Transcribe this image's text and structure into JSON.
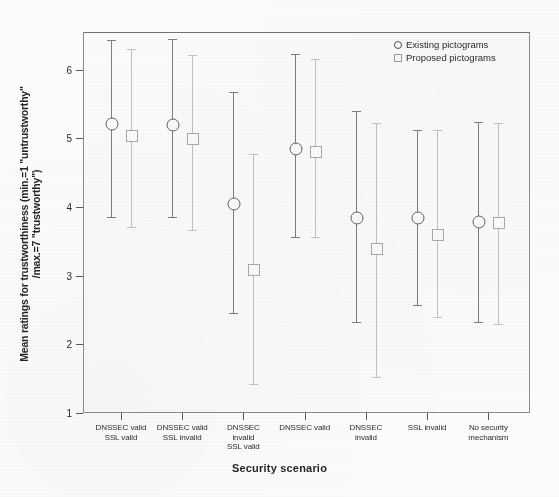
{
  "chart_data": {
    "type": "scatter",
    "title": "",
    "xlabel": "Security scenario",
    "ylabel": "Mean ratings for trustworthiness (min.=1 \"untrustworthy\" /max.=7 \"trustworthy\")",
    "ylabel_line1": "Mean ratings for trustworthiness (min.=1 \"untrustworthy\"",
    "ylabel_line2": "/max.=7 \"trustworthy\")",
    "ylim": [
      1,
      6.55
    ],
    "yticks": [
      1,
      2,
      3,
      4,
      5,
      6
    ],
    "ytick_labels": [
      "1",
      "2",
      "3",
      "4",
      "5",
      "6"
    ],
    "grid": false,
    "legend_position": "top-right",
    "error_bar_type": "95% CI",
    "categories": [
      "DNSSEC valid\nSSL valid",
      "DNSSEC valid\nSSL invalid",
      "DNSSEC invalid\nSSL valid",
      "DNSSEC valid",
      "DNSSEC invalid",
      "SSL invalid",
      "No security mechanism"
    ],
    "category_labels": [
      [
        "DNSSEC valid",
        "SSL valid"
      ],
      [
        "DNSSEC valid",
        "SSL invalid"
      ],
      [
        "DNSSEC",
        "invalid",
        "SSL valid"
      ],
      [
        "DNSSEC valid"
      ],
      [
        "DNSSEC",
        "invalid"
      ],
      [
        "SSL invalid"
      ],
      [
        "No security",
        "mechanism"
      ]
    ],
    "series": [
      {
        "name": "Existing pictograms",
        "marker": "circle",
        "color": "#7b7b7b",
        "values": [
          5.22,
          5.21,
          4.06,
          4.86,
          3.85,
          3.85,
          3.79
        ],
        "ci_lower": [
          3.85,
          3.86,
          2.46,
          3.57,
          2.33,
          2.58,
          2.33
        ],
        "ci_upper": [
          6.44,
          6.45,
          5.67,
          6.23,
          5.4,
          5.12,
          5.24
        ]
      },
      {
        "name": "Proposed pictograms",
        "marker": "square",
        "color": "#c0c0c0",
        "values": [
          5.05,
          5.01,
          3.1,
          4.82,
          3.4,
          3.61,
          3.78
        ],
        "ci_lower": [
          3.71,
          3.66,
          1.42,
          3.57,
          1.52,
          2.4,
          2.3
        ],
        "ci_upper": [
          6.3,
          6.22,
          4.78,
          6.16,
          5.22,
          5.12,
          5.23
        ]
      }
    ]
  },
  "legend": {
    "items": [
      {
        "label": "Existing pictograms",
        "marker": "circle"
      },
      {
        "label": "Proposed pictograms",
        "marker": "square"
      }
    ]
  }
}
